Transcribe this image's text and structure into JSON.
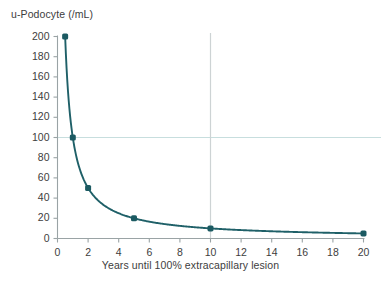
{
  "chart_data": {
    "type": "line",
    "title": "",
    "ylabel": "u-Podocyte (/mL)",
    "xlabel": "Years until 100% extracapillary lesion",
    "x": [
      0.5,
      1,
      2,
      5,
      10,
      20
    ],
    "values": [
      200,
      100,
      50,
      20,
      10,
      5
    ],
    "series": [
      {
        "name": "u-Podocyte",
        "x": [
          0.5,
          1,
          2,
          5,
          10,
          20
        ],
        "values": [
          200,
          100,
          50,
          20,
          10,
          5
        ]
      }
    ],
    "xlim": [
      0,
      20
    ],
    "ylim": [
      0,
      200
    ],
    "xticks": [
      0,
      2,
      4,
      6,
      8,
      10,
      12,
      14,
      16,
      18,
      20
    ],
    "xtick_labels": [
      "0",
      "2",
      "4",
      "6",
      "8",
      "10",
      "12",
      "14",
      "16",
      "18",
      "20"
    ],
    "yticks": [
      0,
      20,
      40,
      60,
      80,
      100,
      120,
      140,
      160,
      180,
      200
    ],
    "ytick_labels": [
      "0",
      "20",
      "40",
      "60",
      "80",
      "100",
      "120",
      "140",
      "160",
      "180",
      "200"
    ],
    "grid": false,
    "legend": "none",
    "markers": true,
    "annotations": [
      {
        "name": "horizontal-reference-line",
        "axis": "y",
        "value": 100,
        "color": "#c7dede"
      },
      {
        "name": "vertical-reference-line",
        "axis": "x",
        "value": 10,
        "color": "#cdd3d4"
      }
    ],
    "colors": {
      "curve": "#1f6068",
      "marker": "#1b5a62",
      "axis": "#9aa3a5",
      "text": "#3d3d3d",
      "hline": "#c7dede",
      "vline": "#cdd3d4",
      "background": "#ffffff"
    }
  }
}
